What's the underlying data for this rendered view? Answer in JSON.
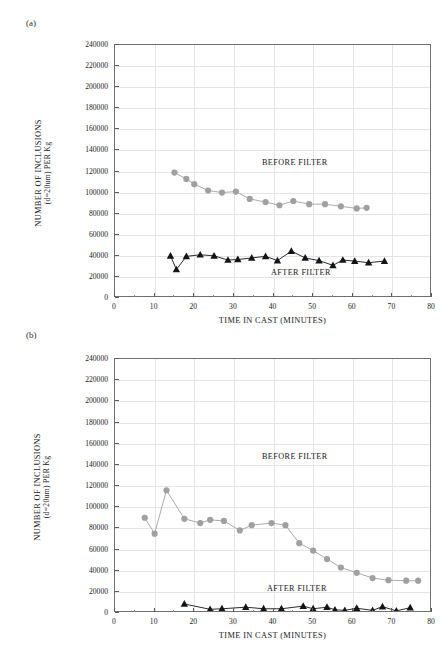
{
  "page": {
    "running_header": "",
    "background": "#ffffff"
  },
  "panels": [
    {
      "id": "a",
      "label": "(a)",
      "axis_x_title": "TIME IN CAST (MINUTES)",
      "axis_y_title_line1": "NUMBER OF INCLUSIONS",
      "axis_y_title_line2": "(d=20um) PER Kg",
      "annotation_before": "BEFORE FILTER",
      "annotation_after": "AFTER FILTER"
    },
    {
      "id": "b",
      "label": "(b)",
      "axis_x_title": "TIME IN CAST (MINUTES)",
      "axis_y_title_line1": "NUMBER OF INCLUSIONS",
      "axis_y_title_line2": "(d=20um) PER Kg",
      "annotation_before": "BEFORE FILTER",
      "annotation_after": "AFTER FILTER"
    }
  ],
  "colors": {
    "before_filter": "#a0a0a0",
    "after_filter": "#141414",
    "grid": "#e3e3ea",
    "axis": "#6f6f6f",
    "text": "#1a1a1a"
  },
  "chart_data": [
    {
      "type": "line",
      "panel": "a",
      "title": "",
      "xlabel": "TIME IN CAST (MINUTES)",
      "ylabel": "NUMBER OF INCLUSIONS (d=20um) PER Kg",
      "xlim": [
        0,
        80
      ],
      "ylim": [
        0,
        240000
      ],
      "xticks": [
        0,
        10,
        20,
        30,
        40,
        50,
        60,
        70,
        80
      ],
      "yticks": [
        0,
        20000,
        40000,
        60000,
        80000,
        100000,
        120000,
        140000,
        160000,
        180000,
        200000,
        220000,
        240000
      ],
      "xtick_labels": [
        "0",
        "10",
        "20",
        "30",
        "40",
        "50",
        "60",
        "70",
        "80"
      ],
      "ytick_labels": [
        "0",
        "20000",
        "40000",
        "60000",
        "80000",
        "100000",
        "120000",
        "140000",
        "160000",
        "180000",
        "200000",
        "220000",
        "240000"
      ],
      "grid": true,
      "legend_position": "inline-annotation",
      "series": [
        {
          "name": "BEFORE FILTER",
          "marker": "circle",
          "color": "#a0a0a0",
          "x": [
            15.0,
            18.0,
            20.0,
            23.5,
            27.0,
            30.5,
            34.0,
            38.0,
            41.5,
            45.0,
            49.0,
            53.0,
            57.0,
            61.0,
            63.5
          ],
          "y": [
            119000,
            113000,
            108000,
            102000,
            100000,
            101000,
            94000,
            91000,
            88000,
            92000,
            89000,
            89000,
            87000,
            85000,
            85500
          ]
        },
        {
          "name": "AFTER FILTER",
          "marker": "triangle",
          "color": "#141414",
          "x": [
            14.0,
            15.5,
            18.0,
            21.5,
            25.0,
            28.5,
            31.0,
            34.5,
            38.0,
            41.0,
            44.5,
            48.0,
            51.5,
            55.0,
            57.5,
            60.5,
            64.0,
            68.0
          ],
          "y": [
            40000,
            27000,
            39500,
            41000,
            40000,
            36000,
            36500,
            38000,
            39500,
            35500,
            44500,
            38000,
            35500,
            31000,
            36000,
            35000,
            33500,
            35000
          ]
        }
      ]
    },
    {
      "type": "line",
      "panel": "b",
      "title": "",
      "xlabel": "TIME IN CAST (MINUTES)",
      "ylabel": "NUMBER OF INCLUSIONS (d=20um) PER Kg",
      "xlim": [
        0,
        80
      ],
      "ylim": [
        0,
        240000
      ],
      "xticks": [
        0,
        10,
        20,
        30,
        40,
        50,
        60,
        70,
        80
      ],
      "yticks": [
        0,
        20000,
        40000,
        60000,
        80000,
        100000,
        120000,
        140000,
        160000,
        180000,
        200000,
        220000,
        240000
      ],
      "xtick_labels": [
        "0",
        "10",
        "20",
        "30",
        "40",
        "50",
        "60",
        "70",
        "80"
      ],
      "ytick_labels": [
        "0",
        "20000",
        "40000",
        "60000",
        "80000",
        "100000",
        "120000",
        "140000",
        "160000",
        "180000",
        "200000",
        "220000",
        "240000"
      ],
      "grid": true,
      "legend_position": "inline-annotation",
      "series": [
        {
          "name": "BEFORE FILTER",
          "marker": "circle",
          "color": "#a0a0a0",
          "x": [
            7.5,
            10.0,
            13.0,
            17.5,
            21.5,
            24.0,
            27.5,
            31.5,
            34.5,
            39.5,
            43.0,
            46.5,
            50.0,
            53.5,
            57.0,
            61.0,
            65.0,
            69.0,
            73.5,
            76.5
          ],
          "y": [
            90000,
            75000,
            116000,
            89000,
            85000,
            88000,
            87000,
            78000,
            83000,
            85000,
            83000,
            66000,
            59000,
            51000,
            43000,
            38000,
            33000,
            31000,
            30500,
            30500
          ]
        },
        {
          "name": "AFTER FILTER",
          "marker": "triangle",
          "color": "#141414",
          "x": [
            17.5,
            24.0,
            27.0,
            33.0,
            37.5,
            42.0,
            47.5,
            50.0,
            53.5,
            55.5,
            58.0,
            61.0,
            65.0,
            67.5,
            71.0,
            74.5
          ],
          "y": [
            8500,
            3500,
            4000,
            5500,
            4000,
            4000,
            6500,
            4000,
            5500,
            3000,
            2500,
            4500,
            2500,
            6000,
            2000,
            5000
          ]
        }
      ]
    }
  ]
}
